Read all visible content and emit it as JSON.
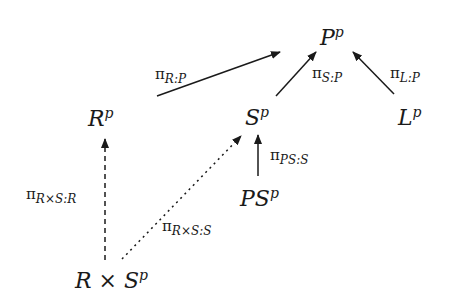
{
  "nodes": {
    "P": {
      "base": "P",
      "sup": "p"
    },
    "R": {
      "base": "R",
      "sup": "p"
    },
    "S": {
      "base": "S",
      "sup": "p"
    },
    "L": {
      "base": "L",
      "sup": "p"
    },
    "PS": {
      "base": "PS",
      "sup": "p"
    },
    "RxS": {
      "base": "R × S",
      "sup": "p"
    }
  },
  "arrows": {
    "r_p": {
      "pi": "π",
      "sub": "R:P",
      "style": "solid"
    },
    "s_p": {
      "pi": "π",
      "sub": "S:P",
      "style": "solid"
    },
    "l_p": {
      "pi": "π",
      "sub": "L:P",
      "style": "solid"
    },
    "ps_s": {
      "pi": "π",
      "sub": "PS:S",
      "style": "solid"
    },
    "rxs_r": {
      "pi": "π",
      "sub": "R×S:R",
      "style": "dashed"
    },
    "rxs_s": {
      "pi": "π",
      "sub": "R×S:S",
      "style": "dotted"
    }
  }
}
